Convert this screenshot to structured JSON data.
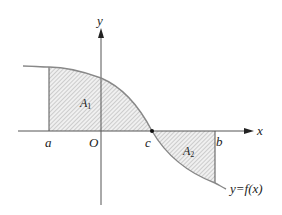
{
  "diagram": {
    "type": "function-area-diagram",
    "axes": {
      "x_label": "x",
      "y_label": "y",
      "origin_label": "O"
    },
    "points": {
      "a": "a",
      "b": "b",
      "c": "c"
    },
    "regions": [
      {
        "label_main": "A",
        "label_sub": "1",
        "description": "area between curve and x-axis from a to c (above x-axis)"
      },
      {
        "label_main": "A",
        "label_sub": "2",
        "description": "area between curve and x-axis from c to b (below x-axis)"
      }
    ],
    "curve_label": "y=f(x)",
    "colors": {
      "axis": "#444444",
      "curve": "#888888",
      "hatch": "#9a9a9a",
      "fill": "#f2f2f2"
    }
  }
}
